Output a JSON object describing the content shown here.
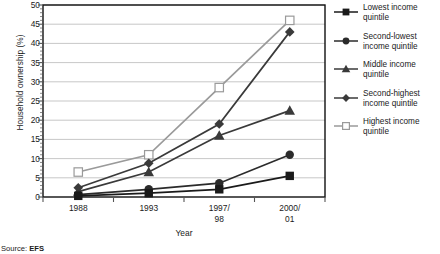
{
  "chart_data": {
    "type": "line",
    "title": "",
    "xlabel": "Year",
    "ylabel": "Household ownership (%)",
    "categories": [
      "1988",
      "1993",
      "1997/\n98",
      "2000/\n01"
    ],
    "ylim": [
      0,
      50
    ],
    "ytick_step": 5,
    "yticks": [
      "0",
      "5",
      "10",
      "15",
      "20",
      "25",
      "30",
      "35",
      "40",
      "45",
      "50"
    ],
    "minor_tick_step": 1,
    "grid": "horizontal",
    "legend_position": "right",
    "series": [
      {
        "name": "Lowest income quintile",
        "marker": "filled-square",
        "color": "#1a1a1a",
        "values": [
          0.3,
          1.0,
          2.0,
          5.5
        ]
      },
      {
        "name": "Second-lowest income quintile",
        "marker": "filled-circle",
        "color": "#2b2b2b",
        "values": [
          0.6,
          2.0,
          3.6,
          11.0
        ]
      },
      {
        "name": "Middle income quintile",
        "marker": "filled-triangle",
        "color": "#3a3a3a",
        "values": [
          1.4,
          6.5,
          16.0,
          22.5
        ]
      },
      {
        "name": "Second-highest income quintile",
        "marker": "filled-diamond",
        "color": "#3a3a3a",
        "values": [
          2.4,
          8.8,
          19.0,
          43.0
        ]
      },
      {
        "name": "Highest income quintile",
        "marker": "open-square",
        "color": "#9a9a9a",
        "values": [
          6.5,
          11.0,
          28.5,
          46.0
        ]
      }
    ]
  },
  "source": {
    "label": "Source:",
    "value": "EFS"
  }
}
